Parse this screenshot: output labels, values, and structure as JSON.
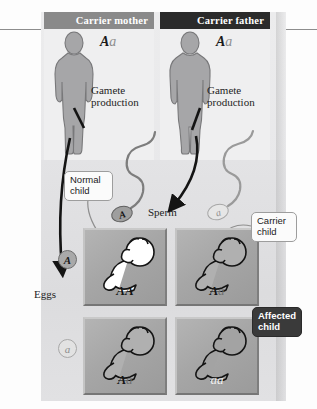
{
  "diagram": {
    "parents": [
      {
        "id": "mother",
        "header": "Carrier mother",
        "header_color": "#8a8a8a",
        "genotype_dominant": "A",
        "genotype_recessive": "a",
        "gamete_label": "Gamete\nproduction",
        "gamete_label_line1": "Gamete",
        "gamete_label_line2": "production",
        "figure_icon": "female-silhouette-icon"
      },
      {
        "id": "father",
        "header": "Carrier father",
        "header_color": "#2b2b2b",
        "genotype_dominant": "A",
        "genotype_recessive": "a",
        "gamete_label_line1": "Gamete",
        "gamete_label_line2": "production",
        "figure_icon": "male-silhouette-icon"
      }
    ],
    "gametes": {
      "eggs_label": "Eggs",
      "sperm_label": "Sperm",
      "egg_alleles": [
        "A",
        "a"
      ],
      "sperm_alleles": [
        "A",
        "a"
      ]
    },
    "punnett": {
      "rows": [
        {
          "egg_allele": "A",
          "cells": [
            {
              "dominant": "A",
              "recessive": "A",
              "genotype": "AA",
              "phenotype": "normal",
              "baby_fill": "#ffffff"
            },
            {
              "dominant": "A",
              "recessive": "a",
              "genotype": "Aa",
              "phenotype": "carrier",
              "baby_fill": "#b0b0b0"
            }
          ]
        },
        {
          "egg_allele": "a",
          "cells": [
            {
              "dominant": "A",
              "recessive": "a",
              "genotype": "Aa",
              "phenotype": "carrier",
              "baby_fill": "#b0b0b0"
            },
            {
              "dominant": "a",
              "recessive": "a",
              "genotype": "aa",
              "phenotype": "affected",
              "baby_fill": "#a3a3a3"
            }
          ]
        }
      ]
    },
    "callouts": [
      {
        "id": "normal-child",
        "line1": "Normal",
        "line2": "child",
        "style": "light"
      },
      {
        "id": "carrier-child",
        "line1": "Carrier",
        "line2": "child",
        "style": "light"
      },
      {
        "id": "affected-child",
        "line1": "Affected",
        "line2": "child",
        "style": "dark"
      }
    ],
    "colors": {
      "header_mother": "#8a8a8a",
      "header_father": "#2b2b2b",
      "cell_gray": "#a8a8a8",
      "plate_bg": "#e9e9eb",
      "callout_dark": "#3a3a3a"
    }
  }
}
